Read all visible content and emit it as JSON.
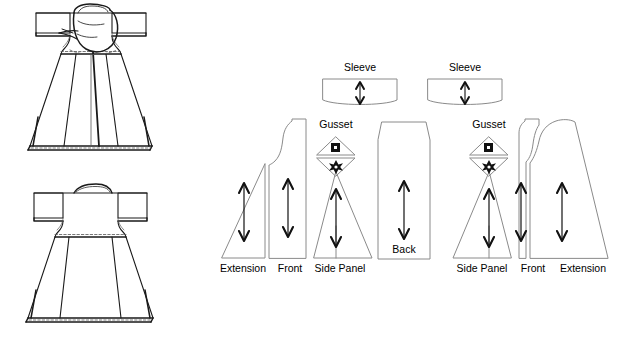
{
  "figure": {
    "type": "technical-illustration",
    "background_color": "#ffffff",
    "line_color": "#808080",
    "line_color_dark": "#1a1a1a",
    "text_color": "#000000"
  },
  "garment_views": [
    {
      "name": "front-view-hooded-garment",
      "position": "upper-left",
      "description": "front view of garment with hood/cowl at neckline, flared A-line skirt with center and side seams and stitched hem"
    },
    {
      "name": "back-view-garment",
      "position": "lower-left",
      "description": "back view of garment with boat neckline, short sleeves, flared A-line skirt with stitched hem"
    }
  ],
  "pattern_pieces": [
    {
      "id": "sleeve-left",
      "label": "Sleeve",
      "label_x": 360,
      "label_y": 71,
      "grain": "vertical"
    },
    {
      "id": "sleeve-right",
      "label": "Sleeve",
      "label_x": 465,
      "label_y": 71,
      "grain": "vertical"
    },
    {
      "id": "gusset-left",
      "label": "Gusset",
      "label_x": 336,
      "label_y": 127,
      "grain": "none"
    },
    {
      "id": "gusset-right",
      "label": "Gusset",
      "label_x": 489,
      "label_y": 127,
      "grain": "none"
    },
    {
      "id": "extension-left",
      "label": "Extension",
      "label_x": 243,
      "label_y": 270,
      "grain": "vertical"
    },
    {
      "id": "front-left",
      "label": "Front",
      "label_x": 290,
      "label_y": 270,
      "grain": "vertical"
    },
    {
      "id": "side-panel-left",
      "label": "Side Panel",
      "label_x": 338,
      "label_y": 270,
      "grain": "vertical"
    },
    {
      "id": "back-center",
      "label": "Back",
      "label_x": 404,
      "label_y": 251,
      "grain": "vertical"
    },
    {
      "id": "side-panel-right",
      "label": "Side Panel",
      "label_x": 480,
      "label_y": 270,
      "grain": "vertical"
    },
    {
      "id": "front-right",
      "label": "Front",
      "label_x": 533,
      "label_y": 270,
      "grain": "vertical"
    },
    {
      "id": "extension-right",
      "label": "Extension",
      "label_x": 583,
      "label_y": 270,
      "grain": "vertical"
    }
  ],
  "markings": {
    "grainline_arrow": "double-headed-vertical-arrow",
    "gusset_top_symbol": "square",
    "gusset_bottom_symbol": "star"
  }
}
